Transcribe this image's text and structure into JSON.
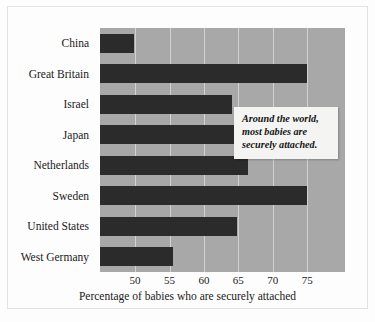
{
  "chart_data": {
    "type": "bar",
    "orientation": "horizontal",
    "title": "",
    "xlabel": "Percentage of babies who are securely attached",
    "ylabel": "",
    "categories": [
      "China",
      "Great Britain",
      "Israel",
      "Japan",
      "Netherlands",
      "Sweden",
      "United States",
      "West Germany"
    ],
    "values": [
      49.9,
      75.0,
      64.1,
      66.9,
      66.4,
      75.0,
      64.8,
      55.5
    ],
    "xlim": [
      44.9,
      80.5
    ],
    "xticks": [
      50,
      55,
      60,
      65,
      70,
      75
    ],
    "xtick_labels": [
      "50",
      "55",
      "60",
      "65",
      "70",
      "75"
    ],
    "grid": true,
    "grid_axis": "x",
    "legend": false,
    "annotations": [
      {
        "text": "Around the world, most babies are securely attached.",
        "lines": [
          "Around the world,",
          "most babies are",
          "securely attached."
        ],
        "style": "italic-bold-callout-box"
      }
    ],
    "colors": {
      "bar": "#2b2b2b",
      "plot_background": "#a8a8a8",
      "gridline": "#d2d2d2",
      "figure_background": "#fdfdfd",
      "callout_background": "#f4f4f2",
      "text": "#1a1a1a"
    }
  },
  "axis_title": "Percentage of babies who are securely attached",
  "callout": {
    "line1": "Around the world,",
    "line2": "most babies are",
    "line3": "securely attached."
  }
}
